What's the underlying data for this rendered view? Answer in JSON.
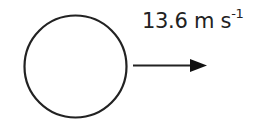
{
  "diagram": {
    "object": {
      "shape": "circle",
      "stroke": "#222222"
    },
    "velocity": {
      "value": "13.6",
      "unit": "m s",
      "unit_exponent": "-1",
      "direction": "right",
      "arrow_color": "#111111"
    }
  }
}
